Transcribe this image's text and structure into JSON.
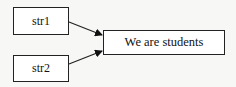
{
  "diagram": {
    "nodes": [
      {
        "id": "str1",
        "label": "str1"
      },
      {
        "id": "str2",
        "label": "str2"
      },
      {
        "id": "target",
        "label": "We are students"
      }
    ],
    "edges": [
      {
        "from": "str1",
        "to": "target"
      },
      {
        "from": "str2",
        "to": "target"
      }
    ],
    "colors": {
      "stroke": "#222222",
      "background": "#f7f7f5"
    }
  }
}
